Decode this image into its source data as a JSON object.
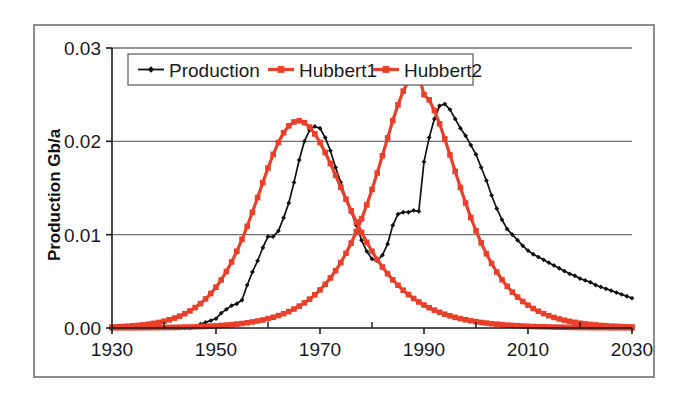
{
  "chart_data": {
    "type": "line",
    "title": "",
    "xlabel": "",
    "ylabel": "Production Gb/a",
    "xlim": [
      1930,
      2030
    ],
    "ylim": [
      0.0,
      0.03
    ],
    "xticks": [
      1930,
      1950,
      1970,
      1990,
      2010,
      2030
    ],
    "xtick_labels": [
      "1930",
      "1950",
      "1970",
      "1990",
      "2010",
      "2030"
    ],
    "minor_xticks": [
      1940,
      1960,
      1980,
      2000,
      2020
    ],
    "yticks": [
      0.0,
      0.01,
      0.02,
      0.03
    ],
    "ytick_labels": [
      "0.00",
      "0.01",
      "0.02",
      "0.03"
    ],
    "grid": "horizontal",
    "legend_position": "top-left-inside",
    "colors": {
      "production": "#111111",
      "hubbert1": "#e8402a",
      "hubbert2": "#e8402a",
      "gridline": "#707070",
      "axis": "#1a1a1a",
      "frame": "#8d8d8d",
      "background": "#ffffff"
    },
    "series": [
      {
        "name": "Production",
        "marker": "diamond",
        "color": "#111111",
        "x": [
          1930,
          1931,
          1932,
          1933,
          1934,
          1935,
          1936,
          1937,
          1938,
          1939,
          1940,
          1941,
          1942,
          1943,
          1944,
          1945,
          1946,
          1947,
          1948,
          1949,
          1950,
          1951,
          1952,
          1953,
          1954,
          1955,
          1956,
          1957,
          1958,
          1959,
          1960,
          1961,
          1962,
          1963,
          1964,
          1965,
          1966,
          1967,
          1968,
          1969,
          1970,
          1971,
          1972,
          1973,
          1974,
          1975,
          1976,
          1977,
          1978,
          1979,
          1980,
          1981,
          1982,
          1983,
          1984,
          1985,
          1986,
          1987,
          1988,
          1989,
          1990,
          1991,
          1992,
          1993,
          1994,
          1995,
          1996,
          1997,
          1998,
          1999,
          2000,
          2001,
          2002,
          2003,
          2004,
          2005,
          2006,
          2007,
          2008,
          2009,
          2010,
          2011,
          2012,
          2013,
          2014,
          2015,
          2016,
          2017,
          2018,
          2019,
          2020,
          2021,
          2022,
          2023,
          2024,
          2025,
          2026,
          2027,
          2028,
          2029,
          2030
        ],
        "y": [
          0,
          0,
          0,
          0,
          0,
          0,
          0,
          0,
          0,
          0,
          0,
          0,
          0,
          0,
          0,
          0,
          0.0002,
          0.0004,
          0.0006,
          0.0008,
          0.001,
          0.0016,
          0.002,
          0.0024,
          0.0026,
          0.003,
          0.0046,
          0.006,
          0.0072,
          0.0086,
          0.0098,
          0.0098,
          0.0104,
          0.0118,
          0.0134,
          0.0156,
          0.018,
          0.02,
          0.0212,
          0.0216,
          0.0214,
          0.0204,
          0.019,
          0.0172,
          0.0156,
          0.0138,
          0.0124,
          0.011,
          0.0094,
          0.0082,
          0.0074,
          0.0072,
          0.0078,
          0.009,
          0.011,
          0.0122,
          0.0124,
          0.0124,
          0.0126,
          0.0125,
          0.0178,
          0.0204,
          0.0224,
          0.0238,
          0.024,
          0.0234,
          0.0224,
          0.0214,
          0.0206,
          0.0196,
          0.0186,
          0.0172,
          0.0158,
          0.0142,
          0.0128,
          0.0116,
          0.0106,
          0.01,
          0.0094,
          0.0088,
          0.0083,
          0.0079,
          0.0076,
          0.0073,
          0.007,
          0.0067,
          0.0064,
          0.0061,
          0.0058,
          0.0056,
          0.0053,
          0.0051,
          0.0049,
          0.0046,
          0.0044,
          0.0042,
          0.004,
          0.0038,
          0.0036,
          0.0034,
          0.0032
        ]
      },
      {
        "name": "Hubbert1",
        "marker": "square",
        "color": "#e8402a",
        "peak_year": 1966,
        "peak_value": 0.0222,
        "x": [
          1930,
          1931,
          1932,
          1933,
          1934,
          1935,
          1936,
          1937,
          1938,
          1939,
          1940,
          1941,
          1942,
          1943,
          1944,
          1945,
          1946,
          1947,
          1948,
          1949,
          1950,
          1951,
          1952,
          1953,
          1954,
          1955,
          1956,
          1957,
          1958,
          1959,
          1960,
          1961,
          1962,
          1963,
          1964,
          1965,
          1966,
          1967,
          1968,
          1969,
          1970,
          1971,
          1972,
          1973,
          1974,
          1975,
          1976,
          1977,
          1978,
          1979,
          1980,
          1981,
          1982,
          1983,
          1984,
          1985,
          1986,
          1987,
          1988,
          1989,
          1990,
          1991,
          1992,
          1993,
          1994,
          1995,
          1996,
          1997,
          1998,
          1999,
          2000,
          2001,
          2002,
          2003,
          2004,
          2005,
          2006,
          2007,
          2008,
          2009,
          2010,
          2011,
          2012,
          2013,
          2014,
          2015,
          2016,
          2017,
          2018,
          2019,
          2020,
          2021,
          2022,
          2023,
          2024,
          2025,
          2026,
          2027,
          2028,
          2029,
          2030
        ],
        "y": [
          0.0001,
          0.00013,
          0.00016,
          0.00019,
          0.00023,
          0.00028,
          0.00034,
          0.00041,
          0.0005,
          0.0006,
          0.00073,
          0.00088,
          0.00106,
          0.00127,
          0.00153,
          0.00183,
          0.00219,
          0.00261,
          0.00311,
          0.00369,
          0.00437,
          0.00515,
          0.00605,
          0.00707,
          0.00822,
          0.0095,
          0.0109,
          0.0124,
          0.01398,
          0.01558,
          0.01714,
          0.0186,
          0.01988,
          0.02092,
          0.02166,
          0.02208,
          0.0222,
          0.022,
          0.02152,
          0.0208,
          0.01988,
          0.0188,
          0.01762,
          0.01636,
          0.01508,
          0.0138,
          0.01256,
          0.01136,
          0.01024,
          0.00918,
          0.00822,
          0.00734,
          0.00654,
          0.00582,
          0.00516,
          0.00458,
          0.00405,
          0.00358,
          0.00316,
          0.00279,
          0.00246,
          0.00217,
          0.00191,
          0.00168,
          0.00148,
          0.0013,
          0.00114,
          0.001,
          0.00088,
          0.00078,
          0.00068,
          0.0006,
          0.00053,
          0.00046,
          0.00041,
          0.00036,
          0.00031,
          0.00028,
          0.00024,
          0.00021,
          0.00019,
          0.00016,
          0.00014,
          0.00013,
          0.00011,
          0.0001,
          9e-05,
          8e-05,
          7e-05,
          6e-05,
          5e-05,
          5e-05,
          4e-05,
          4e-05,
          3e-05,
          3e-05,
          2e-05,
          2e-05,
          2e-05,
          2e-05,
          1e-05
        ]
      },
      {
        "name": "Hubbert2",
        "marker": "square",
        "color": "#e8402a",
        "peak_year": 1990,
        "peak_value": 0.025,
        "x": [
          1930,
          1931,
          1932,
          1933,
          1934,
          1935,
          1936,
          1937,
          1938,
          1939,
          1940,
          1941,
          1942,
          1943,
          1944,
          1945,
          1946,
          1947,
          1948,
          1949,
          1950,
          1951,
          1952,
          1953,
          1954,
          1955,
          1956,
          1957,
          1958,
          1959,
          1960,
          1961,
          1962,
          1963,
          1964,
          1965,
          1966,
          1967,
          1968,
          1969,
          1970,
          1971,
          1972,
          1973,
          1974,
          1975,
          1976,
          1977,
          1978,
          1979,
          1980,
          1981,
          1982,
          1983,
          1984,
          1985,
          1986,
          1987,
          1988,
          1989,
          1990,
          1991,
          1992,
          1993,
          1994,
          1995,
          1996,
          1997,
          1998,
          1999,
          2000,
          2001,
          2002,
          2003,
          2004,
          2005,
          2006,
          2007,
          2008,
          2009,
          2010,
          2011,
          2012,
          2013,
          2014,
          2015,
          2016,
          2017,
          2018,
          2019,
          2020,
          2021,
          2022,
          2023,
          2024,
          2025,
          2026,
          2027,
          2028,
          2029,
          2030
        ],
        "y": [
          1e-05,
          2e-05,
          2e-05,
          2e-05,
          2e-05,
          3e-05,
          3e-05,
          4e-05,
          4e-05,
          5e-05,
          5e-05,
          6e-05,
          7e-05,
          8e-05,
          0.0001,
          0.00011,
          0.00013,
          0.00015,
          0.00017,
          0.0002,
          0.00023,
          0.00027,
          0.00031,
          0.00036,
          0.00042,
          0.00048,
          0.00056,
          0.00065,
          0.00075,
          0.00086,
          0.001,
          0.00115,
          0.00133,
          0.00153,
          0.00176,
          0.00203,
          0.00234,
          0.00269,
          0.00309,
          0.00355,
          0.00408,
          0.00468,
          0.00536,
          0.00614,
          0.00701,
          0.008,
          0.0091,
          0.01034,
          0.0117,
          0.0132,
          0.01484,
          0.0166,
          0.01846,
          0.02036,
          0.02222,
          0.02392,
          0.02538,
          0.02646,
          0.02704,
          0.0271,
          0.025,
          0.02444,
          0.0233,
          0.02188,
          0.02026,
          0.01854,
          0.01678,
          0.01506,
          0.0134,
          0.01184,
          0.01042,
          0.00912,
          0.00796,
          0.00692,
          0.006,
          0.00518,
          0.00447,
          0.00385,
          0.00331,
          0.00284,
          0.00244,
          0.00209,
          0.00179,
          0.00154,
          0.00132,
          0.00113,
          0.00097,
          0.00083,
          0.00071,
          0.00061,
          0.00052,
          0.00044,
          0.00038,
          0.00033,
          0.00028,
          0.00024,
          0.0002,
          0.00018,
          0.00015,
          0.00013,
          0.00011
        ]
      }
    ]
  },
  "legend": {
    "items": [
      {
        "label": "Production",
        "color": "#111111",
        "marker": "diamond"
      },
      {
        "label": "Hubbert1",
        "color": "#e8402a",
        "marker": "square"
      },
      {
        "label": "Hubbert2",
        "color": "#e8402a",
        "marker": "square"
      }
    ]
  },
  "axes": {
    "y_title": "Production Gb/a"
  }
}
